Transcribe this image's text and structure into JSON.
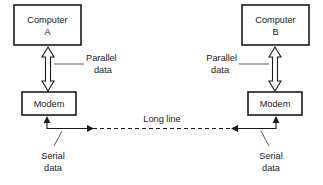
{
  "diagram": {
    "colors": {
      "stroke": "#1a1a1a",
      "background": "#ffffff",
      "leader": "#4a4a4a"
    },
    "nodes": {
      "computer_a": {
        "line1": "Computer",
        "line2": "A"
      },
      "computer_b": {
        "line1": "Computer",
        "line2": "B"
      },
      "modem_left": {
        "label": "Modem"
      },
      "modem_right": {
        "label": "Modem"
      }
    },
    "annotations": {
      "parallel_left": {
        "line1": "Parallel",
        "line2": "data"
      },
      "parallel_right": {
        "line1": "Parallel",
        "line2": "data"
      },
      "serial_left": {
        "line1": "Serial",
        "line2": "data"
      },
      "serial_right": {
        "line1": "Serial",
        "line2": "data"
      },
      "long_line": {
        "label": "Long line"
      }
    }
  }
}
